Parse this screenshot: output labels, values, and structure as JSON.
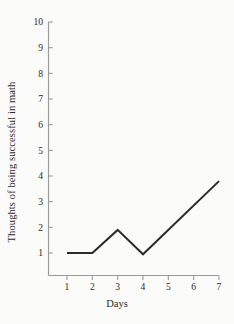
{
  "chart_data": {
    "type": "line",
    "title": "",
    "subtitle": "",
    "xlabel": "Days",
    "ylabel": "Thoughts of being successful in math",
    "x": [
      1,
      2,
      3,
      4,
      7
    ],
    "values": [
      1,
      1,
      1.9,
      0.95,
      3.8
    ],
    "series": [
      {
        "name": "Thoughts of being successful in math",
        "x": [
          1,
          2,
          3,
          4,
          7
        ],
        "values": [
          1,
          1,
          1.9,
          0.95,
          3.8
        ]
      }
    ],
    "xlim": [
      0.3,
      7
    ],
    "ylim": [
      0,
      10
    ],
    "x_ticks": [
      1,
      2,
      3,
      4,
      5,
      6,
      7
    ],
    "x_tick_labels": [
      "1",
      "2",
      "3",
      "4",
      "5",
      "6",
      "7"
    ],
    "y_ticks": [
      1,
      2,
      3,
      4,
      5,
      6,
      7,
      8,
      9,
      10
    ],
    "y_tick_labels": [
      "1",
      "2",
      "3",
      "4",
      "5",
      "6",
      "7",
      "8",
      "9",
      "10"
    ],
    "grid": false,
    "legend": false,
    "legend_position": "none",
    "line_color": "#2b2b2b",
    "axis_color": "#9a9a9a",
    "background_color": "#fbfbfa",
    "annotations": []
  },
  "axes": {
    "y_title": "Thoughts of being successful in math",
    "x_title": "Days"
  },
  "ticks": {
    "y": [
      {
        "label": "10",
        "value": 10
      },
      {
        "label": "9",
        "value": 9
      },
      {
        "label": "8",
        "value": 8
      },
      {
        "label": "7",
        "value": 7
      },
      {
        "label": "6",
        "value": 6
      },
      {
        "label": "5",
        "value": 5
      },
      {
        "label": "4",
        "value": 4
      },
      {
        "label": "3",
        "value": 3
      },
      {
        "label": "2",
        "value": 2
      },
      {
        "label": "1",
        "value": 1
      }
    ],
    "x": [
      {
        "label": "1",
        "value": 1
      },
      {
        "label": "2",
        "value": 2
      },
      {
        "label": "3",
        "value": 3
      },
      {
        "label": "4",
        "value": 4
      },
      {
        "label": "5",
        "value": 5
      },
      {
        "label": "6",
        "value": 6
      },
      {
        "label": "7",
        "value": 7
      }
    ]
  }
}
